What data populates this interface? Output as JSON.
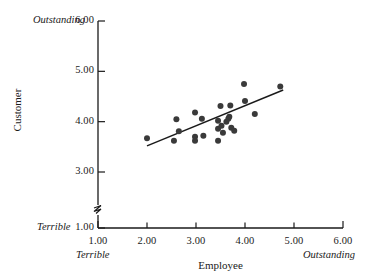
{
  "chart_data": {
    "type": "scatter",
    "title": "",
    "xlabel": "Employee",
    "ylabel": "Customer",
    "xlim": [
      1.0,
      6.0
    ],
    "ylim": [
      1.0,
      6.0
    ],
    "y_axis_break": true,
    "y_break_between": [
      1.0,
      3.0
    ],
    "grid": false,
    "legend": null,
    "xticks": [
      "1.00",
      "2.00",
      "3.00",
      "4.00",
      "5.00",
      "6.00"
    ],
    "xtick_values": [
      1.0,
      2.0,
      3.0,
      4.0,
      5.0,
      6.0
    ],
    "yticks": [
      "1.00",
      "3.00",
      "4.00",
      "5.00",
      "6.00"
    ],
    "ytick_values": [
      1.0,
      3.0,
      4.0,
      5.0,
      6.0
    ],
    "x_anchor_low_label": "Terrible",
    "x_anchor_high_label": "Outstanding",
    "y_anchor_low_label": "Terrible",
    "y_anchor_high_label": "Outstanding",
    "marker": "filled-circle",
    "marker_color": "#3a3a3a",
    "marker_size_px": 5.2,
    "line_color": "#1a1a1a",
    "points": [
      {
        "x": 2.0,
        "y": 3.67
      },
      {
        "x": 2.55,
        "y": 3.62
      },
      {
        "x": 2.6,
        "y": 4.05
      },
      {
        "x": 2.65,
        "y": 3.81
      },
      {
        "x": 2.98,
        "y": 4.18
      },
      {
        "x": 2.98,
        "y": 3.7
      },
      {
        "x": 2.98,
        "y": 3.62
      },
      {
        "x": 3.12,
        "y": 4.06
      },
      {
        "x": 3.15,
        "y": 3.72
      },
      {
        "x": 3.45,
        "y": 4.02
      },
      {
        "x": 3.45,
        "y": 3.86
      },
      {
        "x": 3.45,
        "y": 3.62
      },
      {
        "x": 3.5,
        "y": 4.31
      },
      {
        "x": 3.52,
        "y": 3.92
      },
      {
        "x": 3.55,
        "y": 3.78
      },
      {
        "x": 3.62,
        "y": 4.0
      },
      {
        "x": 3.66,
        "y": 4.06
      },
      {
        "x": 3.68,
        "y": 4.1
      },
      {
        "x": 3.7,
        "y": 4.32
      },
      {
        "x": 3.72,
        "y": 3.88
      },
      {
        "x": 3.78,
        "y": 3.82
      },
      {
        "x": 3.98,
        "y": 4.75
      },
      {
        "x": 4.0,
        "y": 4.41
      },
      {
        "x": 4.2,
        "y": 4.15
      },
      {
        "x": 4.72,
        "y": 4.7
      }
    ],
    "trend_line": {
      "x1": 2.0,
      "y1": 3.52,
      "x2": 4.78,
      "y2": 4.63,
      "type": "linear-fit"
    }
  },
  "axes": {
    "x_title": "Employee",
    "y_title": "Customer"
  }
}
